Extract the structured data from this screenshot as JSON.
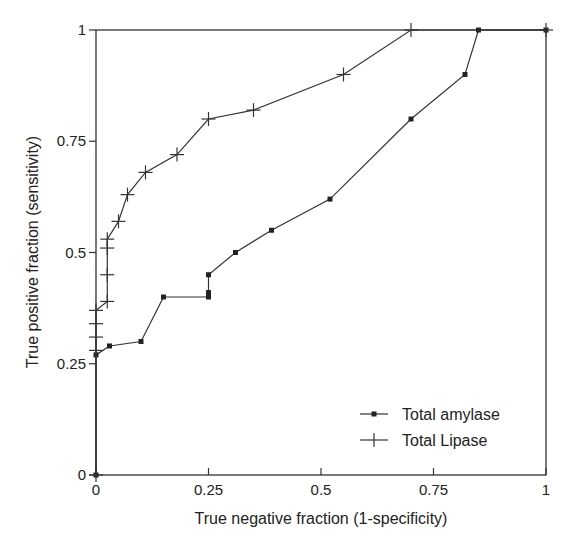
{
  "chart_data": {
    "type": "line",
    "title": "",
    "xlabel": "True negative fraction (1-specificity)",
    "ylabel": "True positive fraction (sensitivity)",
    "xlim": [
      0,
      1
    ],
    "ylim": [
      0,
      1
    ],
    "grid": false,
    "legend_position": "lower right",
    "x_ticks": [
      "0",
      "0.25",
      "0.5",
      "0.75",
      "1"
    ],
    "y_ticks": [
      "0",
      "0.25",
      "0.5",
      "0.75",
      "1"
    ],
    "series": [
      {
        "name": "Total amylase",
        "marker": "square",
        "x": [
          0,
          0,
          0.03,
          0.1,
          0.15,
          0.25,
          0.25,
          0.25,
          0.31,
          0.39,
          0.52,
          0.7,
          0.82,
          0.85,
          1.0
        ],
        "y": [
          0,
          0.27,
          0.29,
          0.3,
          0.4,
          0.4,
          0.41,
          0.45,
          0.5,
          0.55,
          0.62,
          0.8,
          0.9,
          1.0,
          1.0
        ]
      },
      {
        "name": "Total Lipase",
        "marker": "plus",
        "x": [
          0,
          0,
          0,
          0,
          0,
          0.025,
          0.025,
          0.025,
          0.025,
          0.05,
          0.07,
          0.11,
          0.18,
          0.25,
          0.35,
          0.55,
          0.7,
          1.0
        ],
        "y": [
          0,
          0.28,
          0.31,
          0.34,
          0.37,
          0.39,
          0.45,
          0.51,
          0.53,
          0.57,
          0.63,
          0.68,
          0.72,
          0.8,
          0.82,
          0.9,
          1.0,
          1.0
        ]
      }
    ]
  },
  "colors": {
    "line": "#333333",
    "axis": "#333333",
    "background": "#ffffff"
  }
}
